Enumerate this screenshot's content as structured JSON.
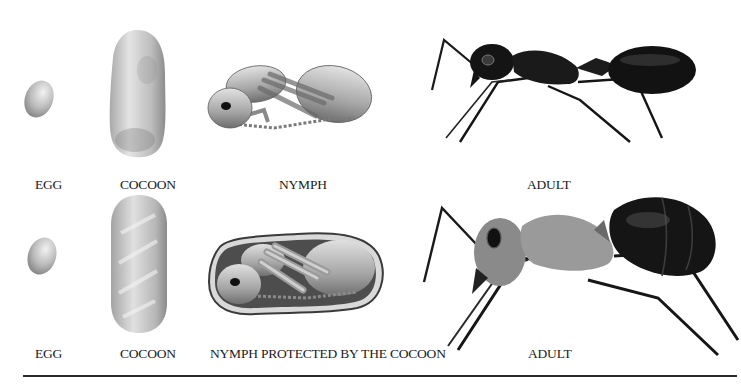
{
  "diagram": {
    "rows": [
      {
        "id": "row-1",
        "stages": [
          {
            "key": "egg",
            "label": "EGG"
          },
          {
            "key": "cocoon",
            "label": "COCOON"
          },
          {
            "key": "nymph",
            "label": "NYMPH"
          },
          {
            "key": "adult",
            "label": "ADULT"
          }
        ]
      },
      {
        "id": "row-2",
        "stages": [
          {
            "key": "egg",
            "label": "EGG"
          },
          {
            "key": "cocoon",
            "label": "COCOON"
          },
          {
            "key": "nymph",
            "label": "NYMPH PROTECTED BY THE COCOON"
          },
          {
            "key": "adult",
            "label": "ADULT"
          }
        ]
      }
    ],
    "colors": {
      "background": "#ffffff",
      "label_text": "#1a1a1a",
      "rule": "#2a2a2a",
      "egg_cocoon_light": "#e6e6e6",
      "egg_cocoon_dark": "#8a8a8a",
      "adult_black": "#141414",
      "adult_gray_thorax": "#8c8c8c"
    }
  }
}
